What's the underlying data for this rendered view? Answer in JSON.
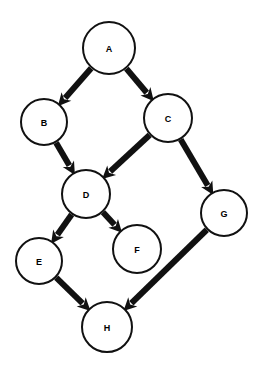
{
  "diagram": {
    "type": "directed-graph",
    "canvas": {
      "width": 266,
      "height": 371,
      "background": "#ffffff"
    },
    "style": {
      "node_fill": "#ffffff",
      "node_stroke": "#111111",
      "node_stroke_width": 2,
      "label_color": "#000000",
      "label_font_size": 9,
      "edge_color": "#111111",
      "edge_width": 6,
      "arrowhead_length": 13,
      "arrowhead_width": 13
    },
    "nodes": [
      {
        "id": "A",
        "label": "A",
        "cx": 109,
        "cy": 48,
        "r": 26
      },
      {
        "id": "B",
        "label": "B",
        "cx": 44,
        "cy": 122,
        "r": 23
      },
      {
        "id": "C",
        "label": "C",
        "cx": 168,
        "cy": 118,
        "r": 24
      },
      {
        "id": "D",
        "label": "D",
        "cx": 86,
        "cy": 194,
        "r": 24
      },
      {
        "id": "E",
        "label": "E",
        "cx": 39,
        "cy": 261,
        "r": 23
      },
      {
        "id": "F",
        "label": "F",
        "cx": 137,
        "cy": 249,
        "r": 24
      },
      {
        "id": "G",
        "label": "G",
        "cx": 224,
        "cy": 213,
        "r": 23
      },
      {
        "id": "H",
        "label": "H",
        "cx": 107,
        "cy": 327,
        "r": 25
      }
    ],
    "edges": [
      {
        "id": "A-B",
        "from": "A",
        "to": "B",
        "directed": true
      },
      {
        "id": "A-C",
        "from": "A",
        "to": "C",
        "directed": true
      },
      {
        "id": "B-D",
        "from": "B",
        "to": "D",
        "directed": true
      },
      {
        "id": "C-D",
        "from": "C",
        "to": "D",
        "directed": true
      },
      {
        "id": "C-G",
        "from": "C",
        "to": "G",
        "directed": true
      },
      {
        "id": "D-E",
        "from": "D",
        "to": "E",
        "directed": true
      },
      {
        "id": "D-F",
        "from": "D",
        "to": "F",
        "directed": true
      },
      {
        "id": "E-H",
        "from": "E",
        "to": "H",
        "directed": true
      },
      {
        "id": "G-H",
        "from": "G",
        "to": "H",
        "directed": true
      }
    ]
  }
}
